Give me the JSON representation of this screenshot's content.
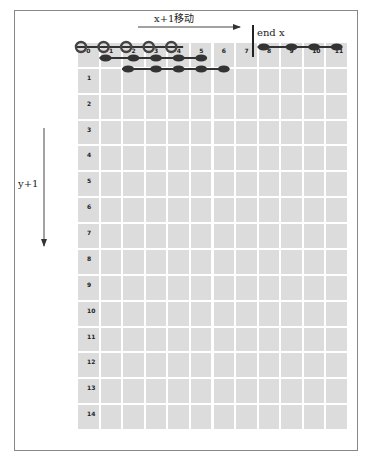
{
  "diagram": {
    "x_arrow_label": "x+1移动",
    "y_arrow_label": "y+1",
    "end_marker_label": "end x",
    "columns": [
      "0",
      "1",
      "2",
      "3",
      "4",
      "5",
      "6",
      "7",
      "8",
      "9",
      "10",
      "11"
    ],
    "rows": [
      "1",
      "2",
      "3",
      "4",
      "5",
      "6",
      "7",
      "8",
      "9",
      "10",
      "11",
      "12",
      "13",
      "14"
    ],
    "chains": [
      {
        "row": 0,
        "start_col": 0,
        "end_col": 4,
        "style": "open-rings"
      },
      {
        "row": 0.5,
        "start_col": 1,
        "end_col": 5,
        "style": "filled-links"
      },
      {
        "row": 1,
        "start_col": 2,
        "end_col": 6,
        "style": "filled-links"
      },
      {
        "row": 0,
        "start_col": 8,
        "end_col": 11,
        "style": "filled-links"
      }
    ],
    "end_x_column": 7.5,
    "colors": {
      "cell": "#dcdcdc",
      "gridline": "#ffffff",
      "chain": "#333333",
      "border": "#888888"
    }
  }
}
